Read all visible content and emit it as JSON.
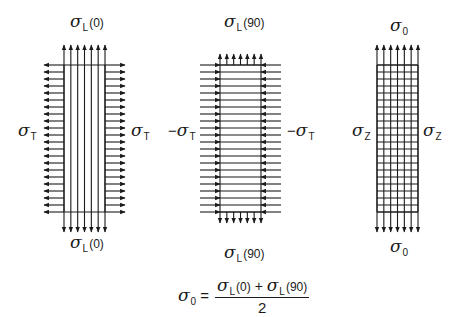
{
  "diagram": {
    "colors": {
      "line": "#1a1a1a",
      "background": "#ffffff"
    },
    "panels": [
      {
        "id": "longitudinal-0",
        "fiber_orientation": "vertical",
        "rect": {
          "x": 64,
          "y": 65,
          "w": 41,
          "h": 147
        },
        "fibers": 7,
        "top_label": {
          "symbol": "σ",
          "sub": "L",
          "arg": "(0)"
        },
        "bottom_label": {
          "symbol": "σ",
          "sub": "L",
          "arg": "(0)"
        },
        "left_label": {
          "prefix": "",
          "symbol": "σ",
          "sub": "T"
        },
        "right_label": {
          "prefix": "",
          "symbol": "σ",
          "sub": "T"
        },
        "vertical_arrows": "outward-long",
        "side_arrows": "outward",
        "side_rows": 22
      },
      {
        "id": "longitudinal-90",
        "fiber_orientation": "horizontal",
        "rect": {
          "x": 220,
          "y": 65,
          "w": 41,
          "h": 147
        },
        "fibers": 22,
        "top_label": {
          "symbol": "σ",
          "sub": "L",
          "arg": "(90)"
        },
        "bottom_label": {
          "symbol": "σ",
          "sub": "L",
          "arg": "(90)"
        },
        "left_label": {
          "prefix": "−",
          "symbol": "σ",
          "sub": "T"
        },
        "right_label": {
          "prefix": "−",
          "symbol": "σ",
          "sub": "T"
        },
        "vertical_arrows": "outward-short",
        "side_arrows": "inward",
        "side_rows": 22
      },
      {
        "id": "combined",
        "fiber_orientation": "grid",
        "rect": {
          "x": 377,
          "y": 65,
          "w": 41,
          "h": 147
        },
        "fibers": 7,
        "top_label": {
          "symbol": "σ",
          "sub": "0",
          "arg": ""
        },
        "bottom_label": {
          "symbol": "σ",
          "sub": "0",
          "arg": ""
        },
        "left_label": {
          "prefix": "",
          "symbol": "σ",
          "sub": "Z"
        },
        "right_label": {
          "prefix": "",
          "symbol": "σ",
          "sub": "Z"
        },
        "vertical_arrows": "outward-long",
        "side_arrows": "none",
        "side_rows": 22
      }
    ],
    "formula": {
      "lhs": {
        "symbol": "σ",
        "sub": "0"
      },
      "equals": "=",
      "numerator": {
        "term1": {
          "symbol": "σ",
          "sub": "L",
          "arg": "(0)"
        },
        "operator": "+",
        "term2": {
          "symbol": "σ",
          "sub": "L",
          "arg": "(90)"
        }
      },
      "denominator": "2"
    }
  }
}
